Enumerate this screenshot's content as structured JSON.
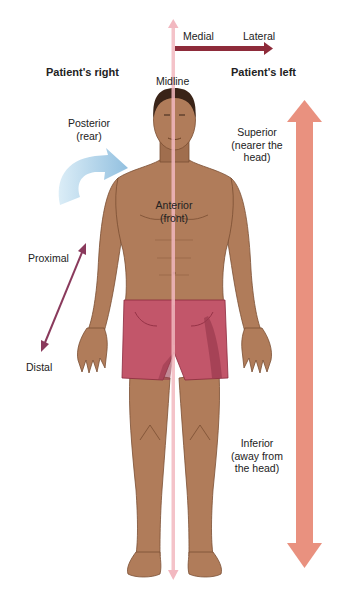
{
  "figure": {
    "labels": {
      "patients_right": "Patient's right",
      "patients_left": "Patient's left",
      "midline": "Midline",
      "medial": "Medial",
      "lateral": "Lateral",
      "posterior_line1": "Posterior",
      "posterior_line2": "(rear)",
      "anterior_line1": "Anterior",
      "anterior_line2": "(front)",
      "superior_line1": "Superior",
      "superior_line2": "(nearer the",
      "superior_line3": "head)",
      "inferior_line1": "Inferior",
      "inferior_line2": "(away from",
      "inferior_line3": "the head)",
      "proximal": "Proximal",
      "distal": "Distal"
    },
    "colors": {
      "midline_arrow": "#f2b8c0",
      "medial_lateral_arrow": "#8e2b3a",
      "superior_inferior_arrow": "#e9917f",
      "proximal_distal_arrow": "#8a3a5c",
      "posterior_arrow": "#9ec9e4",
      "skin": "#b07c5a",
      "skin_shadow": "#8a5a3c",
      "hair": "#3a2418",
      "shorts": "#c2566a",
      "shorts_shadow": "#9a3a4e"
    }
  }
}
